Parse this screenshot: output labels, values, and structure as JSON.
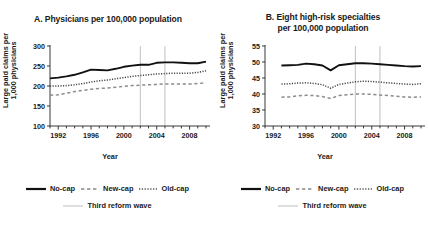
{
  "figure": {
    "background": "#ffffff",
    "text_color": "#1a1a1a",
    "reform_line_color": "#b0b0b0"
  },
  "panels": [
    {
      "id": "A",
      "title_line1": "A. Physicians per 100,000 population",
      "title_line2": "",
      "ylabel": "Large paid claims per 1,000 physicians",
      "xlabel": "Year"
    },
    {
      "id": "B",
      "title_line1": "B. Eight high-risk specialties",
      "title_line2": "per 100,000 population",
      "ylabel": "Large paid claims per 1,000 physicians",
      "xlabel": "Year"
    }
  ],
  "legend": {
    "items": [
      {
        "label": "No-cap",
        "style": "solid"
      },
      {
        "label": "New-cap",
        "style": "dashed"
      },
      {
        "label": "Old-cap",
        "style": "dotted"
      }
    ],
    "reform": {
      "label": "Third reform wave",
      "style": "thin-solid-grey"
    }
  },
  "chart_data": [
    {
      "type": "line",
      "panel": "A",
      "title": "A. Physicians per 100,000 population",
      "xlabel": "Year",
      "ylabel": "Large paid claims per 1,000 physicians",
      "xlim": [
        1991,
        2010
      ],
      "ylim": [
        100,
        300
      ],
      "yticks": [
        100,
        150,
        200,
        250,
        300
      ],
      "xticks": [
        1992,
        1996,
        2000,
        2004,
        2008
      ],
      "xminor_step": 1,
      "grid": false,
      "legend_position": "below",
      "annotations": [
        {
          "type": "vline",
          "label": "Third reform wave",
          "x": 2002
        },
        {
          "type": "vline",
          "label": "Third reform wave",
          "x": 2005
        }
      ],
      "x": [
        1991,
        1992,
        1993,
        1994,
        1995,
        1996,
        1997,
        1998,
        1999,
        2000,
        2001,
        2002,
        2003,
        2004,
        2005,
        2006,
        2007,
        2008,
        2009,
        2010
      ],
      "series": [
        {
          "name": "No-cap",
          "style": "solid",
          "values": [
            219,
            221,
            224,
            228,
            234,
            241,
            240,
            239,
            243,
            248,
            251,
            253,
            253,
            258,
            259,
            259,
            258,
            257,
            257,
            261
          ]
        },
        {
          "name": "Old-cap",
          "style": "dotted",
          "values": [
            200,
            200,
            201,
            203,
            206,
            210,
            213,
            215,
            218,
            221,
            224,
            226,
            228,
            230,
            231,
            232,
            232,
            232,
            234,
            238
          ]
        },
        {
          "name": "New-cap",
          "style": "dashed",
          "values": [
            177,
            178,
            182,
            186,
            189,
            192,
            194,
            195,
            197,
            199,
            201,
            202,
            203,
            204,
            205,
            205,
            205,
            205,
            206,
            208
          ]
        }
      ]
    },
    {
      "type": "line",
      "panel": "B",
      "title": "B. Eight high-risk specialties per 100,000 population",
      "xlabel": "Year",
      "ylabel": "Large paid claims per 1,000 physicians",
      "xlim": [
        1991,
        2010
      ],
      "ylim": [
        30,
        55
      ],
      "yticks": [
        30,
        35,
        40,
        45,
        50,
        55
      ],
      "xticks": [
        1992,
        1996,
        2000,
        2004,
        2008
      ],
      "xminor_step": 1,
      "grid": false,
      "legend_position": "below",
      "annotations": [
        {
          "type": "vline",
          "label": "Third reform wave",
          "x": 2002
        },
        {
          "type": "vline",
          "label": "Third reform wave",
          "x": 2005
        }
      ],
      "x": [
        1993,
        1994,
        1995,
        1996,
        1997,
        1998,
        1999,
        2000,
        2001,
        2002,
        2003,
        2004,
        2005,
        2006,
        2007,
        2008,
        2009,
        2010
      ],
      "series": [
        {
          "name": "No-cap",
          "style": "solid",
          "values": [
            48.9,
            49.0,
            49.1,
            49.5,
            49.3,
            48.9,
            47.4,
            49.0,
            49.3,
            49.6,
            49.6,
            49.5,
            49.3,
            49.1,
            48.9,
            48.7,
            48.6,
            48.7
          ]
        },
        {
          "name": "Old-cap",
          "style": "dotted",
          "values": [
            43.1,
            43.2,
            43.4,
            43.5,
            43.3,
            42.9,
            41.8,
            43.0,
            43.4,
            43.8,
            44.0,
            43.9,
            43.7,
            43.5,
            43.3,
            43.1,
            43.0,
            43.2
          ]
        },
        {
          "name": "New-cap",
          "style": "dashed",
          "values": [
            39.0,
            39.1,
            39.4,
            39.6,
            39.5,
            39.2,
            38.6,
            39.5,
            39.8,
            40.0,
            40.0,
            39.9,
            39.7,
            39.5,
            39.3,
            39.1,
            39.0,
            39.1
          ]
        }
      ]
    }
  ]
}
